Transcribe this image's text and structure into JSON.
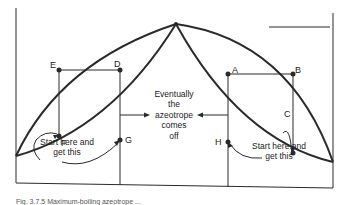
{
  "diagram": {
    "type": "azeotrope-distillation-phase-diagram",
    "colors": {
      "ink": "#2a2a2a",
      "background": "#ffffff"
    },
    "points": {
      "A": "A",
      "B": "B",
      "C": "C",
      "D": "D",
      "E": "E",
      "F": "F",
      "G": "G",
      "H": "H"
    },
    "annotations": {
      "center": [
        "Eventually",
        "the",
        "azeotrope",
        "comes",
        "off"
      ],
      "left": [
        "Start here and",
        "get this"
      ],
      "right": [
        "Start here and",
        "get this"
      ]
    },
    "caption": "Fig. 3.7.5 Maximum-boiling azeotrope ..."
  }
}
